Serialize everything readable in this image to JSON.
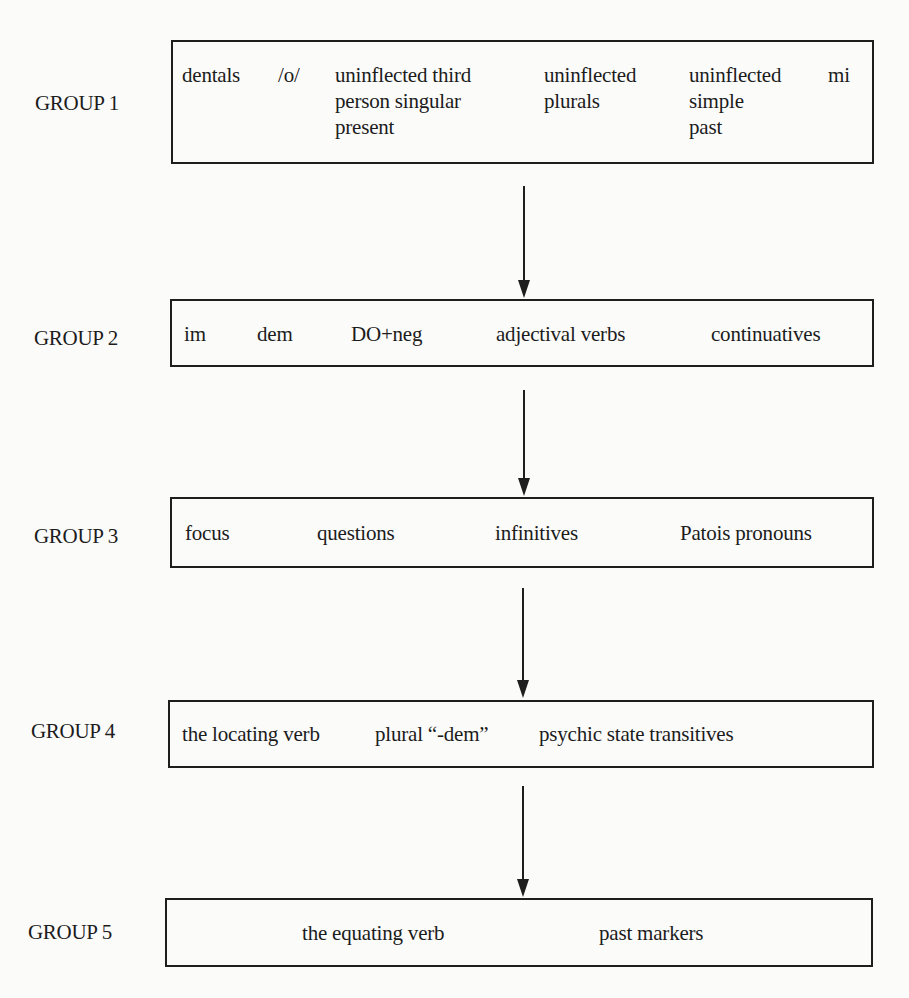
{
  "diagram": {
    "type": "flow",
    "direction": "top-to-bottom",
    "line_color": "#1e1e1e",
    "groups": [
      {
        "label": "GROUP 1",
        "items": [
          "dentals",
          "/o/",
          "uninflected third\nperson singular\npresent",
          "uninflected\nplurals",
          "uninflected\nsimple\npast",
          "mi"
        ]
      },
      {
        "label": "GROUP 2",
        "items": [
          "im",
          "dem",
          "DO+neg",
          "adjectival verbs",
          "continuatives"
        ]
      },
      {
        "label": "GROUP 3",
        "items": [
          "focus",
          "questions",
          "infinitives",
          "Patois pronouns"
        ]
      },
      {
        "label": "GROUP 4",
        "items": [
          "the locating verb",
          "plural “-dem”",
          "psychic state transitives"
        ]
      },
      {
        "label": "GROUP 5",
        "items": [
          "the equating verb",
          "past markers"
        ]
      }
    ],
    "edges": [
      {
        "from": "GROUP 1",
        "to": "GROUP 2"
      },
      {
        "from": "GROUP 2",
        "to": "GROUP 3"
      },
      {
        "from": "GROUP 3",
        "to": "GROUP 4"
      },
      {
        "from": "GROUP 4",
        "to": "GROUP 5"
      }
    ]
  }
}
